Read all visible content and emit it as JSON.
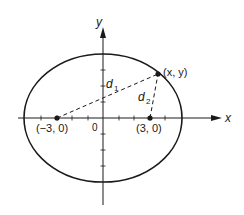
{
  "diagram": {
    "type": "ellipse-foci",
    "axes": {
      "x_label": "x",
      "y_label": "y",
      "origin_label": "0"
    },
    "ellipse": {
      "center": [
        0,
        0
      ],
      "semi_major_units": 5,
      "semi_minor_units": 4
    },
    "foci": [
      {
        "label": "(−3, 0)",
        "coords": [
          -3,
          0
        ]
      },
      {
        "label": "(3, 0)",
        "coords": [
          3,
          0
        ]
      }
    ],
    "point": {
      "label": "(x, y)"
    },
    "distances": [
      {
        "name": "d",
        "subscript": "1",
        "from": "(−3, 0)",
        "to": "(x, y)"
      },
      {
        "name": "d",
        "subscript": "2",
        "from": "(3, 0)",
        "to": "(x, y)"
      }
    ],
    "colors": {
      "ink": "#1a1a1a",
      "background": "#ffffff"
    }
  }
}
